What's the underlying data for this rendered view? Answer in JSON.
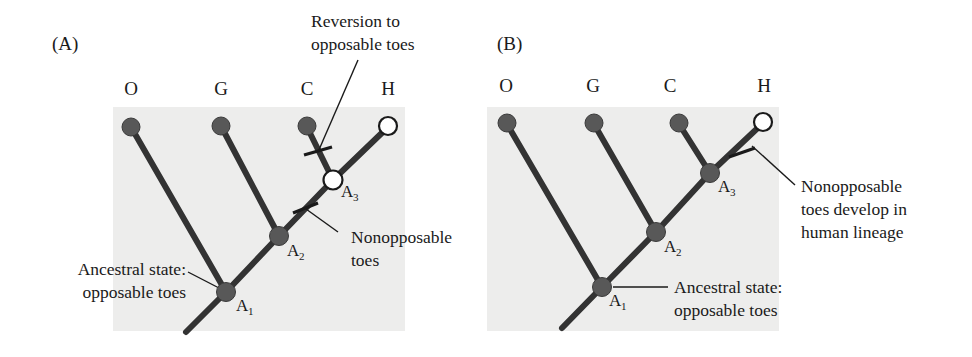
{
  "figure": {
    "background_color": "#ffffff",
    "panel_fill": "#ededec",
    "branch_color": "#333333",
    "node_fill_color": "#585858",
    "node_open_fill": "#ffffff",
    "node_stroke": "#1a1a1a",
    "text_color": "#1a1a1a"
  },
  "panels": [
    {
      "letter": "(A)",
      "tip_labels": [
        "O",
        "G",
        "C",
        "H"
      ],
      "tip_states": [
        "opposable",
        "opposable",
        "opposable",
        "nonopposable"
      ],
      "internal_nodes": [
        {
          "name": "A",
          "sub": "1",
          "state": "opposable"
        },
        {
          "name": "A",
          "sub": "2",
          "state": "opposable"
        },
        {
          "name": "A",
          "sub": "3",
          "state": "nonopposable"
        }
      ],
      "annotations": [
        {
          "id": "reversion",
          "lines": [
            "Reversion to",
            "opposable toes"
          ]
        },
        {
          "id": "nonopposable",
          "lines": [
            "Nonopposable",
            "toes"
          ]
        },
        {
          "id": "ancestral",
          "lines": [
            "Ancestral state:",
            "opposable toes"
          ]
        }
      ]
    },
    {
      "letter": "(B)",
      "tip_labels": [
        "O",
        "G",
        "C",
        "H"
      ],
      "tip_states": [
        "opposable",
        "opposable",
        "opposable",
        "nonopposable"
      ],
      "internal_nodes": [
        {
          "name": "A",
          "sub": "1",
          "state": "opposable"
        },
        {
          "name": "A",
          "sub": "2",
          "state": "opposable"
        },
        {
          "name": "A",
          "sub": "3",
          "state": "opposable"
        }
      ],
      "annotations": [
        {
          "id": "human-lineage",
          "lines": [
            "Nonopposable",
            "toes develop in",
            "human lineage"
          ]
        },
        {
          "id": "ancestral",
          "lines": [
            "Ancestral state:",
            "opposable toes"
          ]
        }
      ]
    }
  ]
}
